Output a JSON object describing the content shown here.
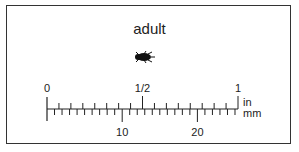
{
  "title": "adult",
  "specimen_icon": "beetle-icon",
  "ruler": {
    "inch_labels": [
      {
        "value": 0,
        "text": "0"
      },
      {
        "value": 0.5,
        "text": "1/2"
      },
      {
        "value": 1,
        "text": "1"
      }
    ],
    "inch_unit": "in",
    "mm_unit": "mm",
    "mm_labels": [
      {
        "value": 10,
        "text": "10"
      },
      {
        "value": 20,
        "text": "20"
      }
    ],
    "inch_subdivisions": 16,
    "mm_max": 25
  }
}
